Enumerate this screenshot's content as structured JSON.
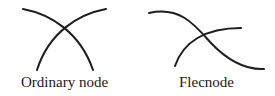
{
  "diagrams": [
    {
      "name": "ordinary-node",
      "label": "Ordinary node",
      "description": "Two curves crossing transversally at a single point"
    },
    {
      "name": "flecnode",
      "label": "Flecnode",
      "description": "Two curves crossing where one branch has an inflection point at the node"
    }
  ],
  "style": {
    "stroke_color": "#1e1e1e",
    "background": "#ffffff"
  }
}
